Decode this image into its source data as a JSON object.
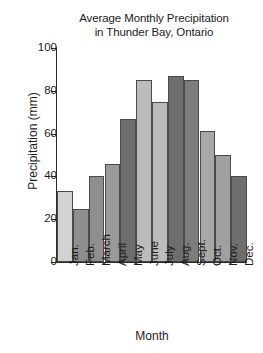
{
  "chart_data": {
    "type": "bar",
    "title": "Average Monthly Precipitation in Thunder Bay, Ontario",
    "title_lines": [
      "Average Monthly Precipitation",
      "in Thunder Bay, Ontario"
    ],
    "xlabel": "Month",
    "ylabel": "Precipitation (mm)",
    "categories": [
      "Jan.",
      "Feb.",
      "March",
      "April",
      "May",
      "June",
      "July",
      "Aug.",
      "Sept.",
      "Oct.",
      "Nov.",
      "Dec."
    ],
    "values": [
      33,
      25,
      40,
      46,
      67,
      85,
      75,
      87,
      85,
      61,
      50,
      40
    ],
    "ylim": [
      0,
      100
    ],
    "yticks": [
      0,
      20,
      40,
      60,
      80,
      100
    ],
    "ytick_labels": [
      "0",
      "20",
      "40",
      "60",
      "80",
      "100"
    ],
    "grid": false,
    "legend": null,
    "bar_colors": [
      "#d2d2d2",
      "#8e8e8e",
      "#8e8e8e",
      "#9a9a9a",
      "#6e6e6e",
      "#bcbcbc",
      "#bcbcbc",
      "#6e6e6e",
      "#7d7d7d",
      "#a8a8a8",
      "#a0a0a0",
      "#6e6e6e"
    ]
  }
}
